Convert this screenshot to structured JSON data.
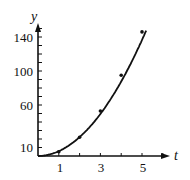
{
  "chart_data": {
    "type": "line",
    "title": "",
    "xlabel": "t",
    "ylabel": "y",
    "x_ticks": [
      1,
      3,
      5
    ],
    "y_ticks": [
      10,
      60,
      100,
      140
    ],
    "xlim": [
      0,
      6
    ],
    "ylim": [
      0,
      160
    ],
    "grid": false,
    "legend": null,
    "series": [
      {
        "name": "curve",
        "x": [
          0,
          1,
          2,
          3,
          4,
          5
        ],
        "y": [
          0,
          5,
          22,
          53,
          95,
          146
        ],
        "markers": true
      }
    ]
  },
  "labels": {
    "x_axis": "t",
    "y_axis": "y",
    "x_tick_labels": [
      "1",
      "3",
      "5"
    ],
    "y_tick_labels": [
      "10",
      "60",
      "100",
      "140"
    ]
  }
}
